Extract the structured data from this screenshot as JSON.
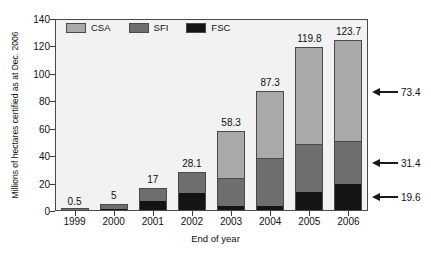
{
  "chart_data": {
    "type": "bar",
    "stacked": true,
    "title": "",
    "xlabel": "End of year",
    "ylabel": "Millions of hectares certified as at Dec. 2006",
    "categories": [
      "1999",
      "2000",
      "2001",
      "2002",
      "2003",
      "2004",
      "2005",
      "2006"
    ],
    "series": [
      {
        "name": "FSC",
        "color": "#141414",
        "values": [
          0.2,
          1.5,
          7.5,
          13.2,
          3.6,
          3.8,
          14.0,
          19.6
        ]
      },
      {
        "name": "SFI",
        "color": "#6e6e6e",
        "values": [
          0.3,
          3.5,
          9.5,
          14.9,
          20.4,
          35.0,
          35.0,
          31.4
        ]
      },
      {
        "name": "CSA",
        "color": "#a9a9a9",
        "values": [
          0.0,
          0.0,
          0.0,
          0.0,
          34.3,
          48.5,
          70.8,
          73.4
        ]
      }
    ],
    "totals": [
      "0.5",
      "5",
      "17",
      "28.1",
      "58.3",
      "87.3",
      "119.8",
      "123.7"
    ],
    "ylim": [
      0,
      140
    ],
    "yticks": [
      "0",
      "20",
      "40",
      "60",
      "80",
      "100",
      "120",
      "140"
    ],
    "grid": false,
    "legend_position": "top-left",
    "annotations": [
      {
        "name": "csa-2006-annotation",
        "value": "73.4",
        "y_value": 87
      },
      {
        "name": "sfi-2006-annotation",
        "value": "31.4",
        "y_value": 35
      },
      {
        "name": "fsc-2006-annotation",
        "value": "19.6",
        "y_value": 10
      }
    ],
    "colors": {
      "plot_background": "#f2f2f2",
      "page_background": "#ffffff",
      "axis": "#4a4a4a",
      "text": "#111111"
    }
  }
}
